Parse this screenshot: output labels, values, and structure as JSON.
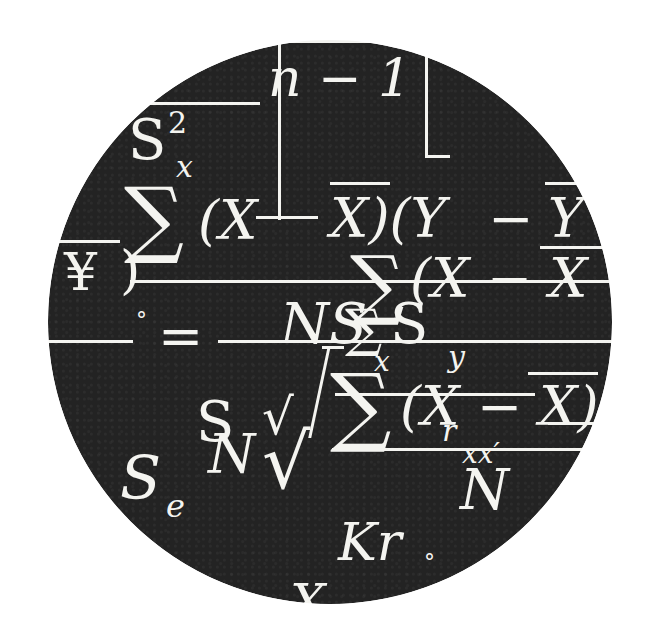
{
  "illustration": {
    "description": "Black circular badge overlaid with white statistics formula glyphs",
    "colors": {
      "disc": "#232323",
      "glyph": "#f4f4f0",
      "background": "#ffffff"
    },
    "glyphs": {
      "n_minus_1": "n − 1",
      "s2": "S",
      "s2_sup": "2",
      "s2_sub": "x",
      "sigma1": "∑",
      "xy_term": "(X",
      "xbar_close": "X)(Y",
      "minus1": "−",
      "ybar": "Y",
      "yen": "¥",
      "paren_close": ")",
      "sigma2": "∑",
      "x_minus_x": "(X − X",
      "ns": "NS",
      "sigma3": "∑",
      "s_y": "S",
      "sub_x": "x",
      "sub_y": "y",
      "degree": "°",
      "equals": "=",
      "sigma4": "∑",
      "x_minus_xbar2": "(X − X)",
      "sub_r": "r",
      "sub_xx": "xx′",
      "s_n": "S",
      "sub_n": "N",
      "n_upper": "N",
      "sqrt1": "√",
      "sqrt2": "√",
      "denominator_n": "N",
      "s_e": "S",
      "sub_e": "e",
      "kr": "Kr",
      "bottom_x": "X",
      "small_circle": "°"
    }
  }
}
